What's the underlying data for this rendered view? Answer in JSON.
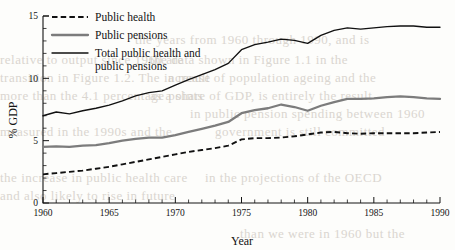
{
  "chart_data": {
    "type": "line",
    "title": "",
    "xlabel": "Year",
    "ylabel": "% GDP",
    "xlim": [
      1960,
      1990
    ],
    "ylim": [
      0,
      15
    ],
    "grid": false,
    "legend_position": "top-left",
    "x_major_ticks": [
      1960,
      1965,
      1970,
      1975,
      1980,
      1985,
      1990
    ],
    "x_major_tick_labels": [
      "1960",
      "1965",
      "1970",
      "1975",
      "1980",
      "1985",
      "1990"
    ],
    "x_minor_tick_step": 1,
    "y_major_ticks": [
      0,
      5,
      10,
      15
    ],
    "y_major_tick_labels": [
      "0",
      "5",
      "10",
      "15"
    ],
    "y_minor_tick_step": 1,
    "x": [
      1960,
      1961,
      1962,
      1963,
      1964,
      1965,
      1966,
      1967,
      1968,
      1969,
      1970,
      1971,
      1972,
      1973,
      1974,
      1975,
      1976,
      1977,
      1978,
      1979,
      1980,
      1981,
      1982,
      1983,
      1984,
      1985,
      1986,
      1987,
      1988,
      1989,
      1990
    ],
    "series": [
      {
        "name": "Public health",
        "color": "#111111",
        "style": "dashed",
        "values": [
          2.3,
          2.4,
          2.5,
          2.6,
          2.75,
          2.9,
          3.1,
          3.3,
          3.5,
          3.7,
          3.9,
          4.1,
          4.25,
          4.4,
          4.6,
          5.1,
          5.2,
          5.2,
          5.25,
          5.35,
          5.5,
          5.65,
          5.7,
          5.6,
          5.55,
          5.6,
          5.6,
          5.6,
          5.6,
          5.65,
          5.7
        ]
      },
      {
        "name": "Public pensions",
        "color": "#7c7c7c",
        "style": "solid-thick",
        "values": [
          4.5,
          4.55,
          4.5,
          4.6,
          4.65,
          4.8,
          5.0,
          5.15,
          5.25,
          5.25,
          5.45,
          5.7,
          5.95,
          6.2,
          6.5,
          7.2,
          7.45,
          7.6,
          7.9,
          7.7,
          7.4,
          7.8,
          8.1,
          8.35,
          8.35,
          8.4,
          8.5,
          8.55,
          8.5,
          8.4,
          8.35
        ]
      },
      {
        "name": "Total public health and public pensions",
        "color": "#111111",
        "style": "solid-thin",
        "values": [
          7.0,
          7.3,
          7.15,
          7.4,
          7.6,
          7.85,
          8.2,
          8.6,
          8.85,
          9.0,
          9.45,
          9.9,
          10.3,
          10.7,
          11.2,
          12.3,
          12.7,
          12.9,
          13.15,
          13.05,
          12.8,
          13.45,
          13.85,
          14.05,
          13.95,
          14.05,
          14.15,
          14.2,
          14.2,
          14.1,
          14.1
        ]
      }
    ]
  },
  "legend": {
    "items": [
      {
        "label": "Public health"
      },
      {
        "label": "Public pensions"
      },
      {
        "label": "Total public health and",
        "label2": "public pensions"
      }
    ]
  },
  "bleed_text": {
    "lines": [
      "the years from 1960 through 1990, and is",
      "the data shown in Figure 1.1 in the",
      "relative to output since 1960 are",
      "a result of population ageing and the",
      "transition in Figure 1.2. The increase",
      "as a share of GDP, is entirely the result",
      "more than the 4.1 percentage points",
      "in public pension spending between 1960",
      "measured in the 1990s and the",
      "government is still committed",
      "the increase in public health care",
      "in the projections of the OECD",
      "and also likely to rise in future",
      "than we were in 1960 but the"
    ]
  }
}
